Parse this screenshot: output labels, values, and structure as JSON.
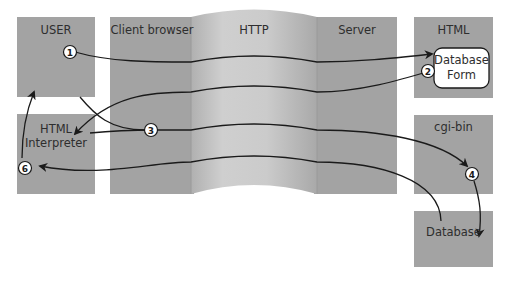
{
  "columns": {
    "client_browser": "Client browser",
    "http": "HTTP",
    "server": "Server"
  },
  "boxes": {
    "user": "USER",
    "html_interpreter_line1": "HTML",
    "html_interpreter_line2": "Interpreter",
    "html": "HTML",
    "database_form_line1": "Database",
    "database_form_line2": "Form",
    "cgi_bin": "cgi-bin",
    "database": "Database"
  },
  "steps": [
    {
      "number": "1",
      "description": "User requests form"
    },
    {
      "number": "2",
      "description": "Server returns database form"
    },
    {
      "number": "3",
      "description": "Interpreter submits form data"
    },
    {
      "number": "4",
      "description": "cgi-bin queries database"
    },
    {
      "number": "6",
      "description": "Result returned to user"
    }
  ],
  "colors": {
    "box_fill": "#a3a3a3",
    "http_fill": "#c8c8c8",
    "arrow": "#1a1a1a",
    "text": "#2e2e2e"
  }
}
